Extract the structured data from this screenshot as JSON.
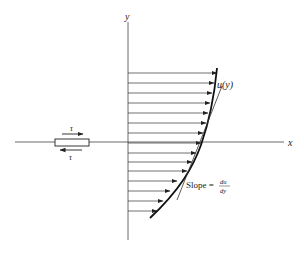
{
  "diagram": {
    "axes": {
      "x_label": "x",
      "y_label": "y",
      "origin": [
        128,
        142
      ],
      "x_range": [
        15,
        287
      ],
      "y_range": [
        15,
        240
      ]
    },
    "profile": {
      "label": "u(y)",
      "arrows": [
        {
          "y": 73,
          "tip_x": 217
        },
        {
          "y": 83,
          "tip_x": 214
        },
        {
          "y": 93,
          "tip_x": 212
        },
        {
          "y": 103,
          "tip_x": 210
        },
        {
          "y": 113,
          "tip_x": 208
        },
        {
          "y": 123,
          "tip_x": 206
        },
        {
          "y": 133,
          "tip_x": 203
        },
        {
          "y": 143,
          "tip_x": 201
        },
        {
          "y": 153,
          "tip_x": 196
        },
        {
          "y": 162,
          "tip_x": 192
        },
        {
          "y": 171,
          "tip_x": 187
        },
        {
          "y": 181,
          "tip_x": 177
        },
        {
          "y": 191,
          "tip_x": 170
        },
        {
          "y": 201,
          "tip_x": 163
        },
        {
          "y": 211,
          "tip_x": 157
        }
      ]
    },
    "tangent": {
      "label_prefix": "Slope = ",
      "numerator": "du",
      "denominator": "dy"
    },
    "element": {
      "stress_top": "τ",
      "stress_bottom": "τ"
    }
  }
}
